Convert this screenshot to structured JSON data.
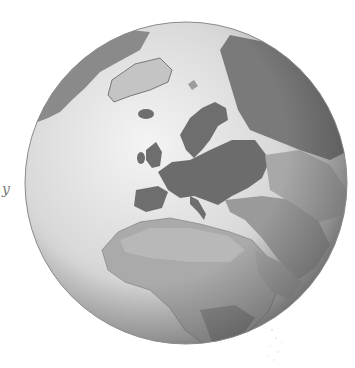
{
  "image": {
    "subject": "Grayscale relief globe centered on Europe, showing Greenland, Iceland, Scandinavia, Europe, North Africa and the Middle East",
    "margin_mark": "y",
    "colors": {
      "background": "#ffffff",
      "ocean_light": "#e6e6e6",
      "ocean_shadow": "#9a9a9a",
      "land_dark": "#6e6e6e",
      "land_mid": "#8c8c8c",
      "land_light": "#b4b4b4",
      "ice": "#d8d8d8"
    },
    "globe": {
      "cx": 186,
      "cy": 183,
      "r": 161
    }
  }
}
